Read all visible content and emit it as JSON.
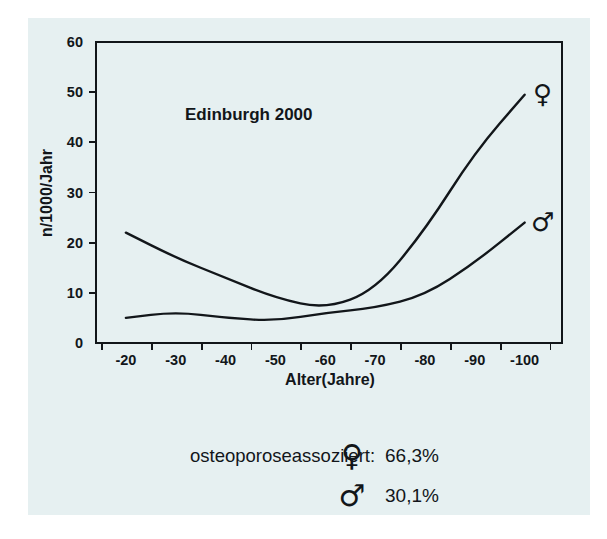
{
  "figure": {
    "background_color": "#e6f0f1",
    "ink_color": "#12161a",
    "page_color": "#ffffff"
  },
  "chart_data": {
    "type": "line",
    "title": "Edinburgh 2000",
    "xlabel": "Alter(Jahre)",
    "ylabel": "n/1000/Jahr",
    "grid": false,
    "legend_position": "right-of-line-ends",
    "xlim": [
      -20,
      -100
    ],
    "ylim": [
      0,
      60
    ],
    "yticks": [
      0,
      10,
      20,
      30,
      40,
      50,
      60
    ],
    "ytick_labels": [
      "0",
      "10",
      "20",
      "30",
      "40",
      "50",
      "60"
    ],
    "xticks": [
      -20,
      -30,
      -40,
      -50,
      -60,
      -70,
      -80,
      -90,
      -100
    ],
    "xtick_labels": [
      "-20",
      "-30",
      "-40",
      "-50",
      "-60",
      "-70",
      "-80",
      "-90",
      "-100"
    ],
    "x": [
      -20,
      -30,
      -40,
      -50,
      -60,
      -70,
      -80,
      -90,
      -100
    ],
    "series": [
      {
        "name": "Frauen",
        "symbol": "♀",
        "symbol_name": "female-symbol",
        "values": [
          22.0,
          17.0,
          13.0,
          9.0,
          6.8,
          10.5,
          22.5,
          38.0,
          49.5
        ]
      },
      {
        "name": "Männer",
        "symbol": "♂",
        "symbol_name": "male-symbol",
        "values": [
          5.0,
          6.2,
          5.0,
          4.4,
          6.0,
          7.0,
          9.5,
          16.0,
          24.0
        ]
      }
    ]
  },
  "footnote": {
    "label": "osteoporoseassoziiert:",
    "rows": [
      {
        "symbol": "♀",
        "symbol_name": "female-symbol",
        "value": "66,3%"
      },
      {
        "symbol": "♂",
        "symbol_name": "male-symbol",
        "value": "30,1%"
      }
    ]
  }
}
